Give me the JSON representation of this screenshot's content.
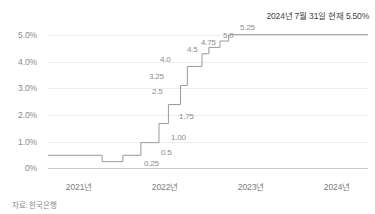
{
  "annotation": {
    "text": "2024년 7월 31일 현재 5.50%"
  },
  "source": {
    "text": "자료: 한국은행"
  },
  "axes": {
    "y_ticks": [
      "5.0%",
      "4.0%",
      "3.0%",
      "2.0%",
      "1.0%",
      "0%"
    ],
    "x_ticks": [
      "2021년",
      "2022년",
      "2023년",
      "2024년"
    ]
  },
  "colors": {
    "line": "#9a9a9a",
    "grid": "#eeeeee",
    "axis": "#c9c9c9",
    "label": "#8c8c8c",
    "annotation": "#3f3f3f",
    "source": "#8a8a8a"
  },
  "chart_data": {
    "type": "line",
    "subtype": "step-post",
    "title": "",
    "subtitle": "",
    "xlabel": "",
    "ylabel": "",
    "ylim": [
      0,
      5.75
    ],
    "xlim": [
      2021.0,
      2024.72
    ],
    "grid": true,
    "legend": false,
    "y_tick_values": [
      5.0,
      4.0,
      3.0,
      2.0,
      1.0,
      0.0
    ],
    "y_tick_labels": [
      "5.0%",
      "4.0%",
      "3.0%",
      "2.0%",
      "1.0%",
      "0%"
    ],
    "x_tick_values": [
      2021.0,
      2022.0,
      2023.0,
      2024.0
    ],
    "x_tick_labels": [
      "2021년",
      "2022년",
      "2023년",
      "2024년"
    ],
    "annotations": [
      "2024년 7월 31일 현재 5.50%"
    ],
    "series": [
      {
        "name": "한국은행 기준금리",
        "x": [
          2021.0,
          2021.63,
          2021.87,
          2022.08,
          2022.29,
          2022.4,
          2022.54,
          2022.62,
          2022.79,
          2022.87,
          2023.0,
          2023.1,
          2024.72
        ],
        "y": [
          0.5,
          0.25,
          0.5,
          1.0,
          1.75,
          2.5,
          3.25,
          4.0,
          4.5,
          4.75,
          5.0,
          5.25,
          5.25
        ],
        "point_labels": [
          {
            "label": "0.25",
            "value": 0.25,
            "x_pct": 31.0,
            "y_pct": 95.5
          },
          {
            "label": "0.5",
            "value": 0.5,
            "x_pct": 42.0,
            "y_pct": 86.5
          },
          {
            "label": "1.00",
            "value": 1.0,
            "x_pct": 47.0,
            "y_pct": 74.5
          },
          {
            "label": "1.75",
            "value": 1.75,
            "x_pct": 50.5,
            "y_pct": 58.5
          },
          {
            "label": "2.5",
            "value": 2.5,
            "x_pct": 36.5,
            "y_pct": 41.5
          },
          {
            "label": "3.25",
            "value": 3.25,
            "x_pct": 36.5,
            "y_pct": 29.0
          },
          {
            "label": "4.0",
            "value": 4.0,
            "x_pct": 41.5,
            "y_pct": 16.5
          },
          {
            "label": "4.5",
            "value": 4.5,
            "x_pct": 52.5,
            "y_pct": 9.5
          },
          {
            "label": "4.75",
            "value": 4.75,
            "x_pct": 59.0,
            "y_pct": 5.0
          },
          {
            "label": "5.0",
            "value": 5.0,
            "x_pct": 67.0,
            "y_pct": 0.5
          },
          {
            "label": "5.25",
            "value": 5.25,
            "x_pct": 74.0,
            "y_pct": -4.0
          }
        ]
      }
    ]
  }
}
